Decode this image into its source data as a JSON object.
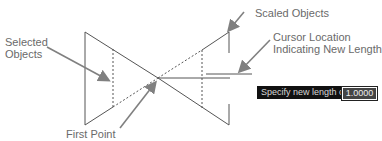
{
  "labels": {
    "selected_objects": "Selected\nObjects",
    "selected_line1": "Selected",
    "selected_line2": "Objects",
    "scaled_objects": "Scaled Objects",
    "cursor_line1": "Cursor Location",
    "cursor_line2": "Indicating New Length",
    "first_point": "First Point"
  },
  "prompt": {
    "text": "Specify new length or",
    "icon": "keyboard-down-arrow-icon",
    "value": "1.0000"
  },
  "colors": {
    "line": "#555555",
    "arrow": "#808080",
    "label": "#6a6a6a",
    "prompt_bg": "#111111"
  }
}
